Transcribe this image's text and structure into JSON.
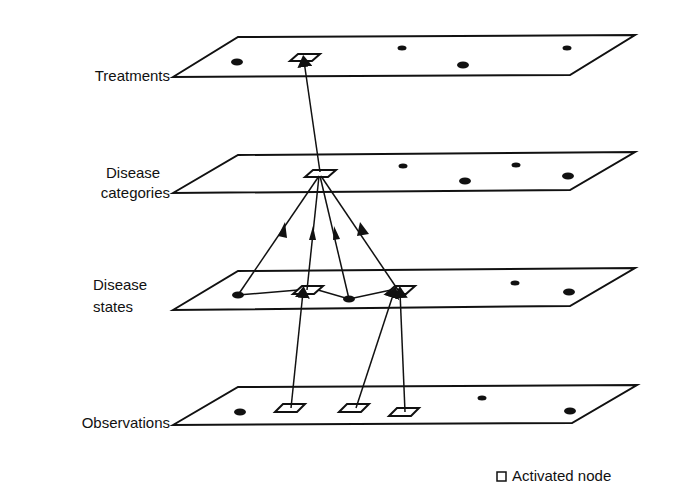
{
  "diagram": {
    "layers": [
      {
        "id": "treatments",
        "label_lines": [
          "Treatments"
        ]
      },
      {
        "id": "disease-categories",
        "label_lines": [
          "Disease",
          "categories"
        ]
      },
      {
        "id": "disease-states",
        "label_lines": [
          "Disease",
          "states"
        ]
      },
      {
        "id": "observations",
        "label_lines": [
          "Observations"
        ]
      }
    ],
    "legend": {
      "symbol": "open-square",
      "label": "Activated node"
    },
    "colors": {
      "ink": "#111111",
      "background": "#ffffff"
    }
  }
}
